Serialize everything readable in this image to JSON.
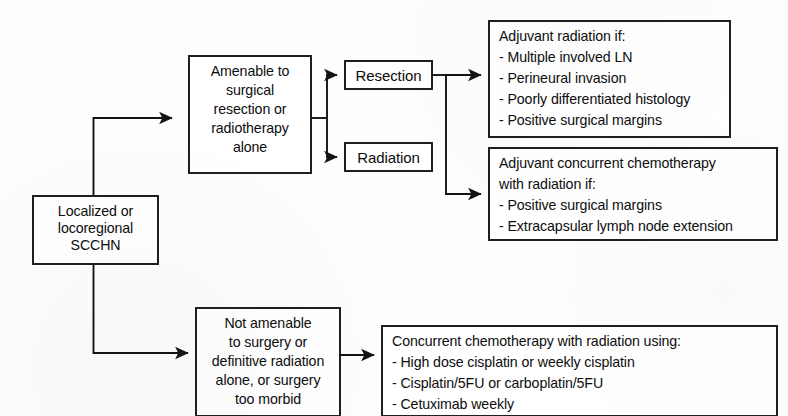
{
  "diagram": {
    "type": "flowchart",
    "orientation": "left-to-right",
    "line_color": "#141414",
    "box_fill": "#ffffff",
    "background": "#fdfdfc"
  },
  "nodes": {
    "root": {
      "id": "localized-scchn",
      "lines": [
        "Localized or",
        "locoregional",
        "SCCHN"
      ],
      "align": "center"
    },
    "amenable": {
      "id": "amenable-surgery-radiotherapy",
      "lines": [
        "Amenable to",
        "surgical",
        "resection or",
        "radiotherapy",
        "alone"
      ],
      "align": "center"
    },
    "resection": {
      "id": "resection",
      "label": "Resection"
    },
    "radiation": {
      "id": "radiation",
      "label": "Radiation"
    },
    "adjuvant_radiation": {
      "id": "adjuvant-radiation-criteria",
      "lines": [
        "Adjuvant radiation if:",
        "- Multiple involved LN",
        "- Perineural invasion",
        "- Poorly differentiated histology",
        "- Positive surgical margins"
      ],
      "align": "left"
    },
    "adjuvant_chemoradiation": {
      "id": "adjuvant-concurrent-chemoradiation-criteria",
      "lines": [
        "Adjuvant concurrent chemotherapy",
        "with radiation if:",
        "- Positive surgical margins",
        "- Extracapsular lymph node extension"
      ],
      "align": "left"
    },
    "not_amenable": {
      "id": "not-amenable-surgery",
      "lines": [
        "Not amenable",
        "to surgery or",
        "definitive radiation",
        "alone, or surgery",
        "too morbid"
      ],
      "align": "center"
    },
    "concurrent_chemoradiation": {
      "id": "concurrent-chemoradiation-regimens",
      "lines": [
        "Concurrent chemotherapy with radiation using:",
        "- High dose cisplatin or weekly cisplatin",
        "- Cisplatin/5FU or carboplatin/5FU",
        "- Cetuximab weekly"
      ],
      "align": "left"
    }
  },
  "edges": [
    {
      "id": "root-to-amenable",
      "from": "localized-scchn",
      "to": "amenable-surgery-radiotherapy",
      "arrow": true
    },
    {
      "id": "root-to-not-amenable",
      "from": "localized-scchn",
      "to": "not-amenable-surgery",
      "arrow": true
    },
    {
      "id": "amenable-to-resection",
      "from": "amenable-surgery-radiotherapy",
      "to": "resection",
      "arrow": true
    },
    {
      "id": "amenable-to-radiation",
      "from": "amenable-surgery-radiotherapy",
      "to": "radiation",
      "arrow": true
    },
    {
      "id": "resection-to-adjuvant-radiation",
      "from": "resection",
      "to": "adjuvant-radiation-criteria",
      "arrow": true
    },
    {
      "id": "resection-to-adjuvant-chemoradiation",
      "from": "resection",
      "to": "adjuvant-concurrent-chemoradiation-criteria",
      "arrow": true
    },
    {
      "id": "not-amenable-to-chemoradiation",
      "from": "not-amenable-surgery",
      "to": "concurrent-chemoradiation-regimens",
      "arrow": true
    }
  ]
}
